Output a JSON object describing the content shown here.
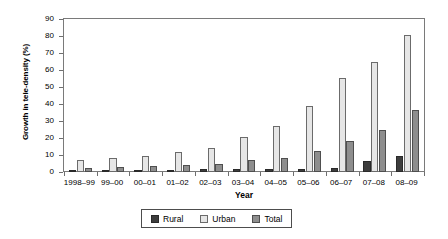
{
  "chart_data": {
    "type": "bar",
    "title": "",
    "xlabel": "Year",
    "ylabel": "Growth in tele-density (%)",
    "ylim": [
      0,
      90
    ],
    "ytick_step": 10,
    "yticks": [
      0,
      10,
      20,
      30,
      40,
      50,
      60,
      70,
      80,
      90
    ],
    "grid": false,
    "legend_position": "bottom-center",
    "categories": [
      "1998–99",
      "99–00",
      "00–01",
      "01–02",
      "02–03",
      "03–04",
      "04–05",
      "05–06",
      "06–07",
      "07–08",
      "08–09"
    ],
    "series": [
      {
        "name": "Rural",
        "color": "#3d3d3d",
        "values": [
          0.8,
          0.9,
          1.0,
          1.0,
          1.5,
          1.6,
          1.8,
          2.0,
          2.5,
          6.5,
          9.5
        ]
      },
      {
        "name": "Urban",
        "color": "#e6e6e6",
        "values": [
          7.0,
          8.0,
          9.5,
          12.0,
          14.0,
          20.5,
          27.0,
          39.0,
          55.5,
          65.0,
          80.5
        ]
      },
      {
        "name": "Total",
        "color": "#8e8e8e",
        "values": [
          2.2,
          2.8,
          3.5,
          4.0,
          5.0,
          7.0,
          8.5,
          12.5,
          18.0,
          25.0,
          36.5
        ]
      }
    ]
  },
  "legend": {
    "entries": [
      {
        "label": "Rural"
      },
      {
        "label": "Urban"
      },
      {
        "label": "Total"
      }
    ]
  },
  "axes": {
    "x_title": "Year",
    "y_title": "Growth in tele-density (%)"
  },
  "colors": {
    "rural": "#3d3d3d",
    "urban": "#e6e6e6",
    "total": "#8e8e8e",
    "frame": "#7a7a7a",
    "background": "#ffffff"
  }
}
